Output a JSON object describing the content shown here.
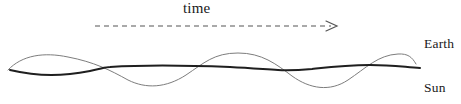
{
  "figure": {
    "type": "diagram",
    "background_color": "#ffffff"
  },
  "time_axis": {
    "label": "time",
    "label_x": 183,
    "label_y": 0,
    "arrow": {
      "style": "dashed",
      "x_start": 95,
      "x_end": 337,
      "y": 26,
      "color": "#555555",
      "dash_pattern": "5,4",
      "head_direction": "right"
    }
  },
  "labels": {
    "earth": "Earth",
    "sun": "Sun"
  },
  "curves": [
    {
      "name": "earth",
      "label": "Earth",
      "stroke": "#7d7d7d",
      "stroke_width": 1.0,
      "style": "thin",
      "baseline_y": 67,
      "amplitude": 12,
      "wavelength": 100,
      "phase": "crest-first",
      "x_start": 8,
      "x_end": 416,
      "path": "M 8,70 C 22,55 44,52 68,57 C 94,62 110,70 128,80 C 146,89 166,88 186,75 C 204,63 214,53 238,53 C 262,53 276,64 292,76 C 310,89 330,92 348,80 C 366,68 378,55 398,54 C 408,53.5 412,57 416,64"
    },
    {
      "name": "sun",
      "label": "Sun",
      "stroke": "#1f1f1f",
      "stroke_width": 2.0,
      "style": "thick",
      "baseline_y": 67,
      "amplitude": 7,
      "wavelength": 100,
      "phase": "trough-first",
      "x_start": 10,
      "x_end": 420,
      "path": "M 10,70 C 40,77 64,76 90,71 C 104,68 106,67 110,67 C 140,65 180,65 230,67 C 250,68 262,69 278,70 C 290,70.5 300,70 312,69 C 330,67 346,65 370,65 C 392,65 404,67 420,68"
    }
  ],
  "crossings": [
    {
      "x": 108,
      "y": 68
    },
    {
      "x": 210,
      "y": 66
    },
    {
      "x": 310,
      "y": 70
    },
    {
      "x": 404,
      "y": 64
    }
  ]
}
